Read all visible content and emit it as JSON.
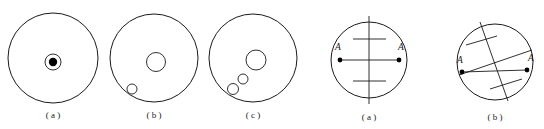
{
  "page": {
    "background_color": "#ffffff",
    "stroke_color": "#1a1a1a",
    "width": 544,
    "height": 129
  },
  "figures": [
    {
      "id": "fig-1",
      "caption": "( a )",
      "kind": "circle-with-concentric-dot",
      "outer": {
        "cx": 53,
        "cy": 58,
        "r": 45
      },
      "inner_circles": [
        {
          "cx": 53,
          "cy": 62,
          "r": 8
        }
      ],
      "filled_dots": [
        {
          "cx": 53,
          "cy": 62,
          "r": 4.2
        }
      ],
      "caption_x": 53,
      "caption_y": 118
    },
    {
      "id": "fig-2",
      "caption": "( b )",
      "kind": "circle-with-two-inner-circles",
      "outer": {
        "cx": 154,
        "cy": 58,
        "r": 44
      },
      "inner_circles": [
        {
          "cx": 156,
          "cy": 62,
          "r": 9.5
        },
        {
          "cx": 132,
          "cy": 89,
          "r": 5
        }
      ],
      "filled_dots": [],
      "caption_x": 154,
      "caption_y": 118
    },
    {
      "id": "fig-3",
      "caption": "( c )",
      "kind": "circle-with-three-inner-circles",
      "outer": {
        "cx": 253,
        "cy": 58,
        "r": 44
      },
      "inner_circles": [
        {
          "cx": 256,
          "cy": 60,
          "r": 10
        },
        {
          "cx": 243,
          "cy": 79,
          "r": 5
        },
        {
          "cx": 233,
          "cy": 89,
          "r": 5.5
        }
      ],
      "filled_dots": [],
      "caption_x": 253,
      "caption_y": 118
    },
    {
      "id": "fig-4",
      "caption": "( a )",
      "kind": "circle-with-perpendicular-bisector",
      "outer": {
        "cx": 369,
        "cy": 60,
        "r": 38
      },
      "chord": {
        "x1": 340,
        "y1": 60,
        "x2": 399,
        "y2": 60
      },
      "axis": {
        "x1": 369,
        "y1": 16,
        "x2": 369,
        "y2": 104
      },
      "tick_marks": [
        {
          "x1": 353,
          "y1": 39,
          "x2": 386,
          "y2": 39
        },
        {
          "x1": 353,
          "y1": 81,
          "x2": 386,
          "y2": 81
        }
      ],
      "endpoints": [
        {
          "cx": 340,
          "cy": 60,
          "r": 2.4,
          "label": "A",
          "lx": 338,
          "ly": 50
        },
        {
          "cx": 399,
          "cy": 60,
          "r": 2.4,
          "label": "A",
          "lx": 400,
          "ly": 50
        }
      ],
      "caption_x": 369,
      "caption_y": 120
    },
    {
      "id": "fig-5",
      "caption": "( b )",
      "kind": "circle-with-oblique-bisector",
      "outer": {
        "cx": 495,
        "cy": 62,
        "r": 38
      },
      "chord": {
        "x1": 462,
        "y1": 72,
        "x2": 527,
        "y2": 70
      },
      "oblique_chord": {
        "x1": 459,
        "y1": 75,
        "x2": 532,
        "y2": 50
      },
      "axis": {
        "x1": 480,
        "y1": 22,
        "x2": 508,
        "y2": 101
      },
      "tick_marks": [
        {
          "x1": 466,
          "y1": 45,
          "x2": 497,
          "y2": 36
        },
        {
          "x1": 490,
          "y1": 89,
          "x2": 522,
          "y2": 79
        }
      ],
      "endpoints": [
        {
          "cx": 462,
          "cy": 72,
          "r": 2.4,
          "label": "A",
          "lx": 461,
          "ly": 62
        },
        {
          "cx": 527,
          "cy": 70,
          "r": 2.4,
          "label": "A",
          "lx": 530,
          "ly": 60
        }
      ],
      "caption_x": 495,
      "caption_y": 120
    }
  ]
}
